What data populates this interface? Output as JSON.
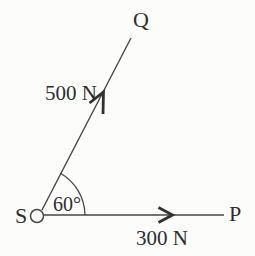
{
  "diagram": {
    "points": {
      "vertex_label": "S",
      "upper_ray_label": "Q",
      "right_ray_label": "P"
    },
    "forces": {
      "sq_magnitude": "500 N",
      "sp_magnitude": "300 N"
    },
    "angle": {
      "value_label": "60°"
    },
    "colors": {
      "line": "#474747",
      "arrow": "#313131",
      "text": "#2e2e2e",
      "background": "#fcfcfa"
    }
  }
}
